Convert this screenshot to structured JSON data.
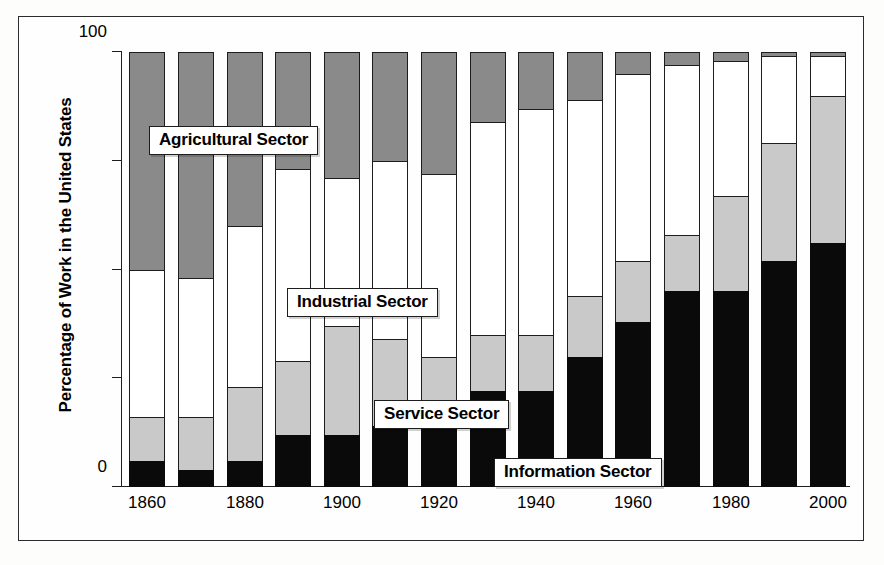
{
  "chart_data": {
    "type": "bar",
    "stacked": true,
    "title": "",
    "xlabel": "",
    "ylabel": "Percentage of Work in the United States",
    "ylim": [
      0,
      100
    ],
    "yticks": [
      0,
      25,
      50,
      75,
      100
    ],
    "ytick_labels": [
      "0",
      "",
      "",
      "",
      "100"
    ],
    "grid": false,
    "legend_position": "inline-callouts",
    "categories": [
      "1860",
      "1870",
      "1880",
      "1890",
      "1900",
      "1910",
      "1920",
      "1930",
      "1940",
      "1950",
      "1960",
      "1970",
      "1980",
      "1990",
      "2000"
    ],
    "xtick_labels": [
      "1860",
      "1880",
      "1900",
      "1920",
      "1940",
      "1960",
      "1980",
      "2000"
    ],
    "series": [
      {
        "name": "Information Sector",
        "color": "#0a0a0a",
        "values": [
          6,
          4,
          6,
          12,
          12,
          14,
          17,
          22,
          22,
          30,
          38,
          45,
          45,
          52,
          56
        ]
      },
      {
        "name": "Service Sector",
        "color": "#c9c9c9",
        "values": [
          10,
          12,
          17,
          17,
          25,
          20,
          13,
          13,
          13,
          14,
          14,
          13,
          22,
          27,
          34
        ]
      },
      {
        "name": "Industrial Sector",
        "color": "#ffffff",
        "values": [
          34,
          32,
          37,
          44,
          34,
          41,
          42,
          49,
          52,
          45,
          43,
          39,
          31,
          20,
          9
        ]
      },
      {
        "name": "Agricultural Sector",
        "color": "#8a8a8a",
        "values": [
          50,
          52,
          40,
          27,
          29,
          25,
          28,
          16,
          13,
          11,
          5,
          3,
          2,
          1,
          1
        ]
      }
    ],
    "annotations": [
      {
        "name": "agricultural-callout",
        "text": "Agricultural Sector"
      },
      {
        "name": "industrial-callout",
        "text": "Industrial Sector"
      },
      {
        "name": "service-callout",
        "text": "Service Sector"
      },
      {
        "name": "information-callout",
        "text": "Information Sector"
      }
    ]
  }
}
